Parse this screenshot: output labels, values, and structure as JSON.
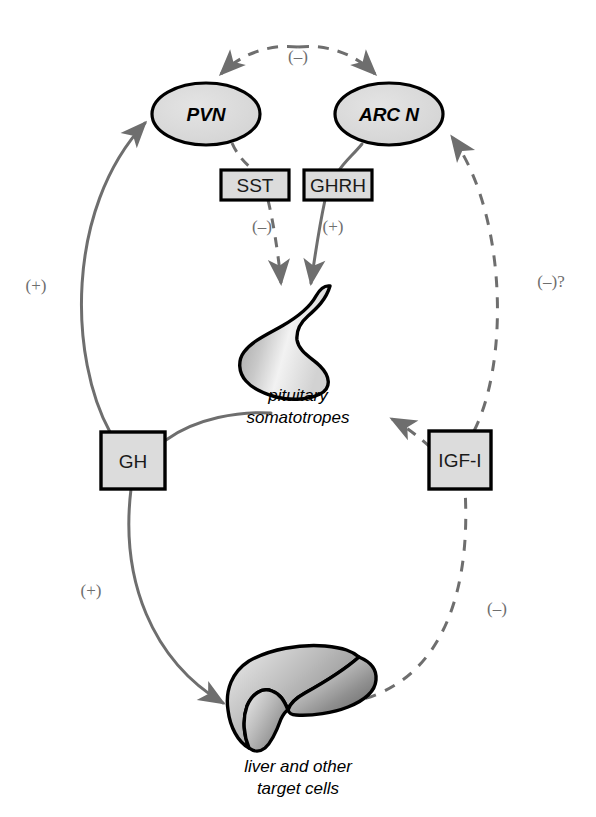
{
  "figure": {
    "background_color": "#ffffff",
    "shape_fill": "#dcdcdc",
    "outline_color": "#000000",
    "arrow_color": "#6e6e6e",
    "text_color": "#000000"
  },
  "nodes": {
    "pvn": {
      "label": "PVN",
      "shape": "ellipse"
    },
    "arc_n": {
      "label": "ARC N",
      "shape": "ellipse"
    },
    "sst": {
      "label": "SST",
      "shape": "rectangle"
    },
    "ghrh": {
      "label": "GHRH",
      "shape": "rectangle"
    },
    "gh": {
      "label": "GH",
      "shape": "rectangle"
    },
    "igf1": {
      "label": "IGF-I",
      "shape": "rectangle"
    },
    "pituitary": {
      "caption_line1": "pituitary",
      "caption_line2": "somatotropes",
      "shape": "organ"
    },
    "liver": {
      "caption_line1": "liver and other",
      "caption_line2": "target cells",
      "shape": "organ"
    }
  },
  "edge_labels": {
    "top_arc": "(–)",
    "sst_to_pituitary": "(–)",
    "ghrh_to_pituitary": "(+)",
    "gh_to_pvn": "(+)",
    "gh_to_liver": "(+)",
    "igf1_to_arcn": "(–)?",
    "liver_to_igf1": "(–)"
  }
}
